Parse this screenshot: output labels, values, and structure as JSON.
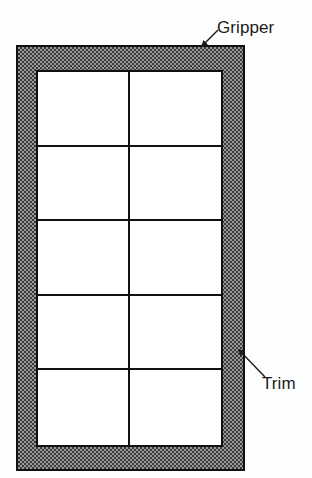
{
  "diagram": {
    "background_color": "#fdfdfd",
    "line_color": "#111111",
    "trim_fill_color": "#9a9a9a",
    "pane_fill_color": "#ffffff",
    "frame": {
      "name": "trim-frame",
      "fill": "dither-checkerboard"
    },
    "panel": {
      "name": "glazing-panel",
      "columns": 2,
      "rows": 5,
      "pane_count": 10
    },
    "panes": [
      {
        "id": "pane-r1c1",
        "row": 1,
        "col": 1
      },
      {
        "id": "pane-r1c2",
        "row": 1,
        "col": 2
      },
      {
        "id": "pane-r2c1",
        "row": 2,
        "col": 1
      },
      {
        "id": "pane-r2c2",
        "row": 2,
        "col": 2
      },
      {
        "id": "pane-r3c1",
        "row": 3,
        "col": 1
      },
      {
        "id": "pane-r3c2",
        "row": 3,
        "col": 2
      },
      {
        "id": "pane-r4c1",
        "row": 4,
        "col": 1
      },
      {
        "id": "pane-r4c2",
        "row": 4,
        "col": 2
      },
      {
        "id": "pane-r5c1",
        "row": 5,
        "col": 1
      },
      {
        "id": "pane-r5c2",
        "row": 5,
        "col": 2
      }
    ],
    "callouts": [
      {
        "id": "gripper",
        "label": "Gripper",
        "target": "top edge of frame band",
        "arrow_from": [
          217,
          31
        ],
        "arrow_to": [
          199,
          48
        ]
      },
      {
        "id": "trim",
        "label": "Trim",
        "target": "right side shaded band",
        "arrow_from": [
          264,
          376
        ],
        "arrow_to": [
          236,
          347
        ]
      }
    ]
  }
}
